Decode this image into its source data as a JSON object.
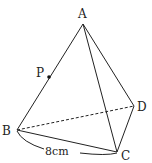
{
  "diagram": {
    "type": "tetrahedron",
    "vertices": {
      "A": {
        "label": "A",
        "x": 83,
        "y": 24,
        "lx": 82,
        "ly": 18
      },
      "B": {
        "label": "B",
        "x": 17,
        "y": 130,
        "lx": 6,
        "ly": 135
      },
      "C": {
        "label": "C",
        "x": 117,
        "y": 152,
        "lx": 126,
        "ly": 159
      },
      "D": {
        "label": "D",
        "x": 134,
        "y": 106,
        "lx": 141,
        "ly": 111
      }
    },
    "point_P": {
      "label": "P",
      "x": 49,
      "y": 77,
      "lx": 40,
      "ly": 76
    },
    "edges_solid": [
      "AB",
      "AC",
      "AD",
      "BC",
      "CD"
    ],
    "edges_dashed": [
      "BD"
    ],
    "measurement": {
      "edge": "BC",
      "label": "8cm",
      "lx": 62,
      "ly": 153
    },
    "colors": {
      "line": "#222222",
      "background": "#ffffff"
    }
  }
}
